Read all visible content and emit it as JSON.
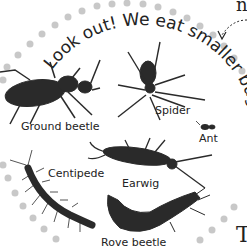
{
  "banner": {
    "curved_text": "Look out! We eat smaller bugs."
  },
  "labels": {
    "ground_beetle": "Ground beetle",
    "spider": "Spider",
    "ant": "Ant",
    "centipede": "Centipede",
    "earwig": "Earwig",
    "rove_beetle": "Rove beetle"
  },
  "page_fragments": {
    "top_right": "n",
    "bottom_right": "T"
  },
  "colors": {
    "dots": "#c8c8c8",
    "text": "#222222",
    "bug_dark": "#2a2a2a"
  }
}
